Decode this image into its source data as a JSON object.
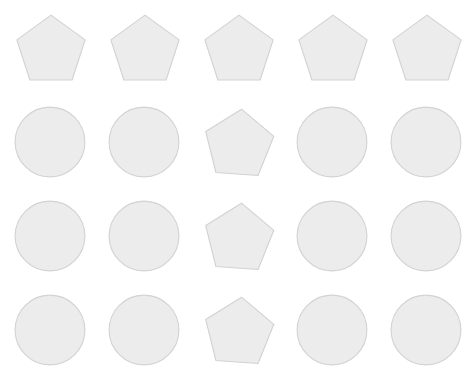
{
  "page": {
    "background_color": "#ffffff",
    "width": 472,
    "height": 389
  },
  "style": {
    "shape_fill_color": "#ececec",
    "shape_stroke_color": "#d2d2d2",
    "shape_stroke_width": 1.1
  },
  "grid": {
    "rows": 4,
    "columns": 5,
    "column_x": [
      14,
      108,
      202,
      296,
      390
    ],
    "row_y": [
      12,
      106,
      200,
      294
    ],
    "cell_width": 76,
    "cell_height": 80
  },
  "shapes": [
    {
      "row": 1,
      "column": 1,
      "type": "pentagon",
      "label": "pentagon",
      "x": 14,
      "y": 12,
      "size": 74,
      "rotation": 0
    },
    {
      "row": 1,
      "column": 2,
      "type": "pentagon",
      "label": "pentagon",
      "x": 108,
      "y": 12,
      "size": 74,
      "rotation": 0
    },
    {
      "row": 1,
      "column": 3,
      "type": "pentagon",
      "label": "pentagon",
      "x": 202,
      "y": 12,
      "size": 74,
      "rotation": 0
    },
    {
      "row": 1,
      "column": 4,
      "type": "pentagon",
      "label": "pentagon",
      "x": 296,
      "y": 12,
      "size": 74,
      "rotation": 0
    },
    {
      "row": 1,
      "column": 5,
      "type": "pentagon",
      "label": "pentagon",
      "x": 390,
      "y": 12,
      "size": 74,
      "rotation": 0
    },
    {
      "row": 2,
      "column": 1,
      "type": "circle",
      "label": "circle",
      "x": 14,
      "y": 106,
      "size": 72,
      "rotation": 0
    },
    {
      "row": 2,
      "column": 2,
      "type": "circle",
      "label": "circle",
      "x": 108,
      "y": 106,
      "size": 72,
      "rotation": 0
    },
    {
      "row": 2,
      "column": 3,
      "type": "pentagon",
      "label": "pentagon",
      "x": 202,
      "y": 106,
      "size": 74,
      "rotation": 4
    },
    {
      "row": 2,
      "column": 4,
      "type": "circle",
      "label": "circle",
      "x": 296,
      "y": 106,
      "size": 72,
      "rotation": 0
    },
    {
      "row": 2,
      "column": 5,
      "type": "circle",
      "label": "circle",
      "x": 390,
      "y": 106,
      "size": 72,
      "rotation": 0
    },
    {
      "row": 3,
      "column": 1,
      "type": "circle",
      "label": "circle",
      "x": 14,
      "y": 200,
      "size": 72,
      "rotation": 0
    },
    {
      "row": 3,
      "column": 2,
      "type": "circle",
      "label": "circle",
      "x": 108,
      "y": 200,
      "size": 72,
      "rotation": 0
    },
    {
      "row": 3,
      "column": 3,
      "type": "pentagon",
      "label": "pentagon",
      "x": 202,
      "y": 200,
      "size": 74,
      "rotation": 4
    },
    {
      "row": 3,
      "column": 4,
      "type": "circle",
      "label": "circle",
      "x": 296,
      "y": 200,
      "size": 72,
      "rotation": 0
    },
    {
      "row": 3,
      "column": 5,
      "type": "circle",
      "label": "circle",
      "x": 390,
      "y": 200,
      "size": 72,
      "rotation": 0
    },
    {
      "row": 4,
      "column": 1,
      "type": "circle",
      "label": "circle",
      "x": 14,
      "y": 294,
      "size": 72,
      "rotation": 0
    },
    {
      "row": 4,
      "column": 2,
      "type": "circle",
      "label": "circle",
      "x": 108,
      "y": 294,
      "size": 72,
      "rotation": 0
    },
    {
      "row": 4,
      "column": 3,
      "type": "pentagon",
      "label": "pentagon",
      "x": 202,
      "y": 294,
      "size": 74,
      "rotation": 4
    },
    {
      "row": 4,
      "column": 4,
      "type": "circle",
      "label": "circle",
      "x": 296,
      "y": 294,
      "size": 72,
      "rotation": 0
    },
    {
      "row": 4,
      "column": 5,
      "type": "circle",
      "label": "circle",
      "x": 390,
      "y": 294,
      "size": 72,
      "rotation": 0
    }
  ]
}
